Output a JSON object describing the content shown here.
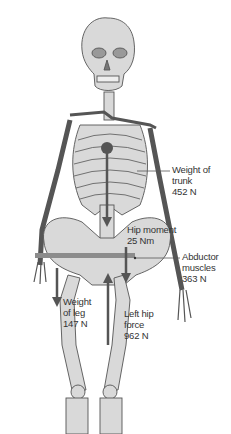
{
  "diagram": {
    "colors": {
      "bone_fill": "#d9d9d9",
      "bone_stroke": "#555555",
      "arrow": "#555555",
      "pelvis_bar": "#8c8c8c",
      "text": "#333333"
    },
    "labels": {
      "trunk": {
        "line1": "Weight of",
        "line2": "trunk",
        "line3": "452 N"
      },
      "hip_moment": {
        "line1": "Hip moment",
        "line2": "25 Nm"
      },
      "abductor": {
        "line1": "Abductor",
        "line2": "muscles",
        "line3": "363 N"
      },
      "leg": {
        "line1": "Weight",
        "line2": "of leg",
        "line3": "147 N"
      },
      "hip_force": {
        "line1": "Left hip",
        "line2": "force",
        "line3": "962 N"
      }
    }
  }
}
